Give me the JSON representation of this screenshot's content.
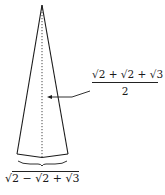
{
  "diagram": {
    "type": "isosceles-triangle",
    "colors": {
      "stroke": "#1a1a1a",
      "background": "#ffffff"
    },
    "height_label": {
      "numerator": {
        "outer_sqrt_prefix": "2 + ",
        "inner_sqrt_prefix": "2 + ",
        "innermost": "3"
      },
      "denominator": "2",
      "text": "√(2+√(2+√3)) / 2"
    },
    "base_label": {
      "outer_sqrt_prefix": "2 − ",
      "inner_sqrt_prefix": "2 + ",
      "innermost": "3",
      "text": "√(2−√(2+√3))"
    },
    "sqrt_symbol": "√"
  }
}
